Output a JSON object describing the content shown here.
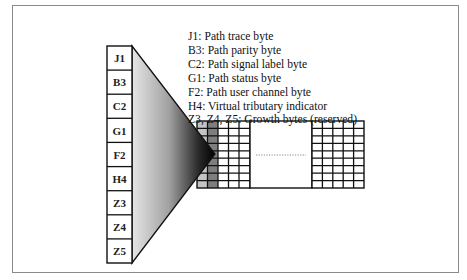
{
  "figure": {
    "top_caption_fragment": "",
    "column_labels": [
      "J1",
      "B3",
      "C2",
      "G1",
      "F2",
      "H4",
      "Z3",
      "Z4",
      "Z5"
    ],
    "legend": [
      "J1:  Path trace byte",
      "B3:  Path parity byte",
      "C2:  Path signal label byte",
      "G1:  Path status byte",
      "F2:  Path user channel byte",
      "H4:  Virtual tributary indicator",
      "Z3, Z4, Z5:  Growth bytes (reserved)"
    ],
    "frame_grid": {
      "rows": 9,
      "left_columns": 5,
      "right_columns": 5,
      "shaded_columns": [
        {
          "index": 0,
          "color": "#c4c4c4"
        },
        {
          "index": 1,
          "color": "#7e7e7e"
        }
      ],
      "ellipsis": "..................."
    }
  }
}
